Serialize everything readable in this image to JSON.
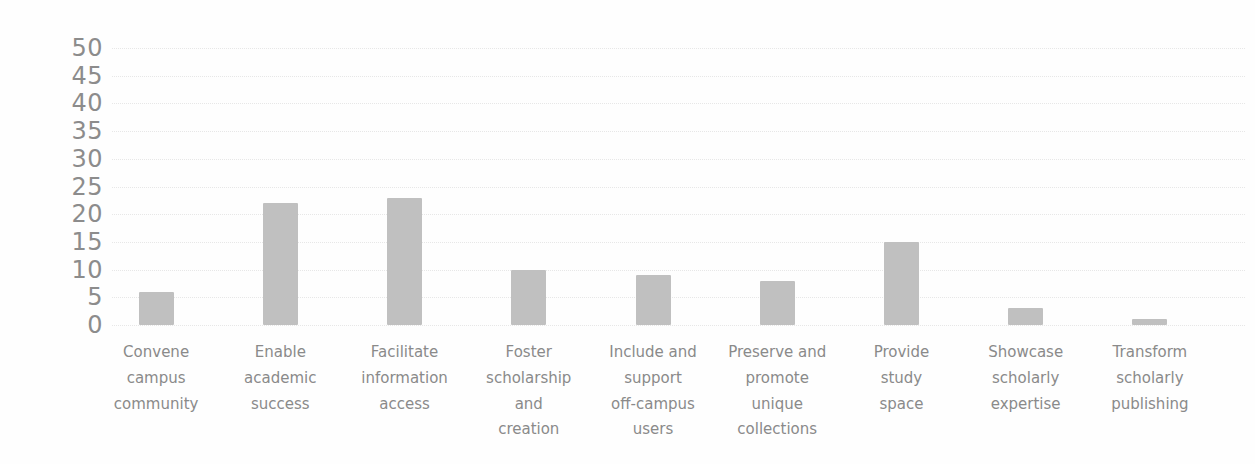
{
  "chart_data": {
    "type": "bar",
    "title": "",
    "xlabel": "",
    "ylabel": "",
    "categories": [
      "Convene\ncampus\ncommunity",
      "Enable\nacademic\nsuccess",
      "Facilitate\ninformation\naccess",
      "Foster\nscholarship\nand\ncreation",
      "Include and\nsupport\noff-campus\nusers",
      "Preserve and\npromote\nunique\ncollections",
      "Provide\nstudy\nspace",
      "Showcase\nscholarly\nexpertise",
      "Transform\nscholarly\npublishing"
    ],
    "values": [
      6,
      22,
      23,
      10,
      9,
      8,
      15,
      3,
      1
    ],
    "ylim": [
      0,
      50
    ],
    "yticks": [
      0,
      5,
      10,
      15,
      20,
      25,
      30,
      35,
      40,
      45,
      50
    ],
    "grid": "horizontal-dotted",
    "legend": "none",
    "bar_color": "#c0c0c0",
    "tick_text_color": "#8c8c8c",
    "category_text_color": "#8a8a8a",
    "gridline_color": "#e7e7e7",
    "background_color": "#fefefe"
  }
}
